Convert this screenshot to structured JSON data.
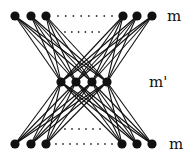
{
  "diagram": {
    "labels": {
      "top": "m",
      "middle": "m'",
      "bottom": "m"
    },
    "layers": {
      "top": {
        "y": 16,
        "nodes_x": [
          15,
          31,
          46,
          123,
          137,
          152
        ]
      },
      "middle": {
        "y": 82,
        "nodes_x": [
          61,
          76,
          92,
          107
        ]
      },
      "bottom": {
        "y": 144,
        "nodes_x": [
          15,
          31,
          46,
          122,
          137,
          152
        ]
      }
    },
    "ellipsis_rows": [
      {
        "y": 16,
        "x_start": 58,
        "x_end": 112,
        "count": 8
      },
      {
        "y": 32,
        "x_start": 65,
        "x_end": 99,
        "count": 6
      },
      {
        "y": 129,
        "x_start": 65,
        "x_end": 100,
        "count": 6
      },
      {
        "y": 144,
        "x_start": 56,
        "x_end": 112,
        "count": 9
      }
    ],
    "edges": "complete bipartite between top layer and middle layer, and between middle layer and bottom layer",
    "colors": {
      "ink": "#111111",
      "background": "#ffffff"
    }
  }
}
